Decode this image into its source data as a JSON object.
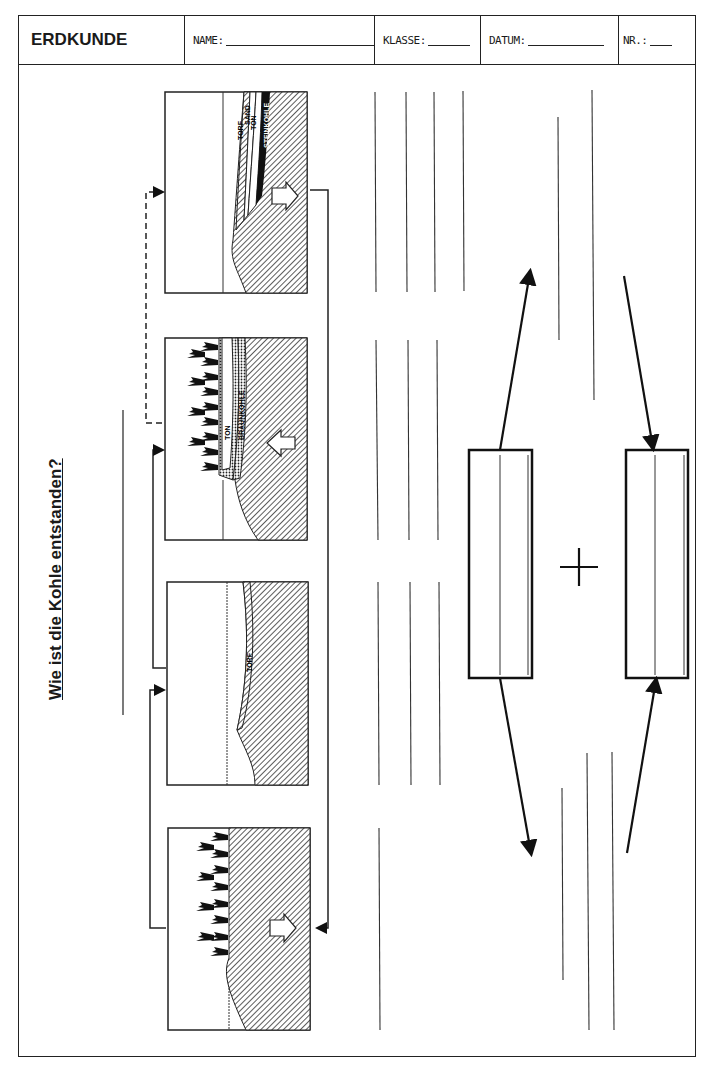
{
  "header": {
    "subject": "ERDKUNDE",
    "fields": [
      {
        "label": "NAME:",
        "blank_width": 150
      },
      {
        "label": "KLASSE:",
        "blank_width": 42
      },
      {
        "label": "DATUM:",
        "blank_width": 76
      },
      {
        "label": "NR.:",
        "blank_width": 22
      }
    ]
  },
  "worksheet": {
    "title": "Wie ist die Kohle entstanden?",
    "panels": [
      {
        "id": 1,
        "stage": "forest",
        "labels": [],
        "arrow": "right"
      },
      {
        "id": 2,
        "stage": "peat",
        "labels": [
          "TORF"
        ],
        "arrow": null
      },
      {
        "id": 3,
        "stage": "lignite",
        "labels": [
          "TON",
          "BRAUNKOHLE"
        ],
        "arrow": "left"
      },
      {
        "id": 4,
        "stage": "hard-coal",
        "labels": [
          "TORF",
          "SAND",
          "TON",
          "STEINKOHLE"
        ],
        "arrow": "right"
      }
    ],
    "formula": {
      "operator": "+",
      "boxes": [
        {
          "id": "left-box",
          "value": ""
        },
        {
          "id": "right-box",
          "value": ""
        }
      ]
    },
    "answer_lines": "blank writing lines"
  }
}
